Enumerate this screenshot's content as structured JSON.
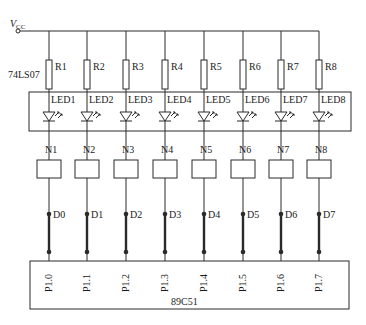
{
  "supply": {
    "label": "V",
    "subscript": "CC"
  },
  "driver_label": "74LS07",
  "chip_label": "89C51",
  "channels": [
    {
      "x": 49,
      "resistor": "R1",
      "led": "LED1",
      "node": "N1",
      "data": "D0",
      "pin": "P1.0"
    },
    {
      "x": 87,
      "resistor": "R2",
      "led": "LED2",
      "node": "N2",
      "data": "D1",
      "pin": "P1.1"
    },
    {
      "x": 126,
      "resistor": "R3",
      "led": "LED3",
      "node": "N3",
      "data": "D2",
      "pin": "P1.2"
    },
    {
      "x": 165,
      "resistor": "R4",
      "led": "LED4",
      "node": "N4",
      "data": "D3",
      "pin": "P1.3"
    },
    {
      "x": 204,
      "resistor": "R5",
      "led": "LED5",
      "node": "N5",
      "data": "D4",
      "pin": "P1.4"
    },
    {
      "x": 243,
      "resistor": "R6",
      "led": "LED6",
      "node": "N6",
      "data": "D5",
      "pin": "P1.5"
    },
    {
      "x": 281,
      "resistor": "R7",
      "led": "LED7",
      "node": "N7",
      "data": "D6",
      "pin": "P1.6"
    },
    {
      "x": 319,
      "resistor": "R8",
      "led": "LED8",
      "node": "N8",
      "data": "D7",
      "pin": "P1.7"
    }
  ],
  "colors": {
    "line": "#2a2a2a",
    "text": "#1a1a1a",
    "background": "#ffffff"
  }
}
